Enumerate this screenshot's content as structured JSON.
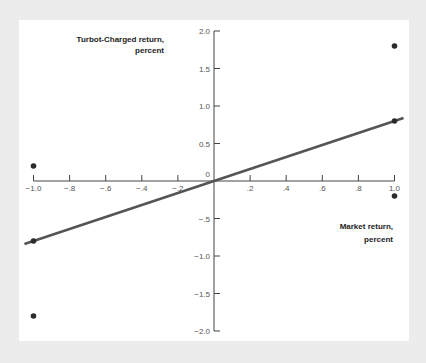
{
  "chart_data": {
    "type": "scatter",
    "title": "",
    "xlabel": "Market return, percent",
    "ylabel": "Turbot-Charged return, percent",
    "xlim": [
      -1.0,
      1.0
    ],
    "ylim": [
      -2.0,
      2.0
    ],
    "x_ticks": [
      -1.0,
      -0.8,
      -0.6,
      -0.4,
      -0.2,
      0.2,
      0.4,
      0.6,
      0.8,
      1.0
    ],
    "x_tick_labels": [
      "−1.0",
      "−.8",
      "−.6",
      "−.4",
      "−.2",
      ".2",
      ".4",
      ".6",
      ".8",
      "1.0"
    ],
    "y_ticks": [
      2.0,
      1.5,
      1.0,
      0.5,
      0,
      -0.5,
      -1.0,
      -1.5,
      -2.0
    ],
    "y_tick_labels": [
      "2.0",
      "1.5",
      "1.0",
      "0.5",
      "0",
      "−.5",
      "−1.0",
      "−1.5",
      "−2.0"
    ],
    "grid": false,
    "legend": null,
    "series": [
      {
        "name": "points",
        "type": "scatter",
        "points": [
          {
            "x": -1.0,
            "y": 0.2
          },
          {
            "x": -1.0,
            "y": -0.8
          },
          {
            "x": -1.0,
            "y": -1.8
          },
          {
            "x": 1.0,
            "y": 1.8
          },
          {
            "x": 1.0,
            "y": 0.8
          },
          {
            "x": 1.0,
            "y": -0.2
          }
        ]
      },
      {
        "name": "fitted line",
        "type": "line",
        "slope": 0.8,
        "points": [
          {
            "x": -1.05,
            "y": -0.84
          },
          {
            "x": 1.05,
            "y": 0.84
          }
        ]
      }
    ],
    "colors": {
      "points": "#2b2b2b",
      "line": "#555555",
      "axis": "#444444",
      "background": "#ffffff",
      "frame": "#ececec"
    }
  },
  "labels": {
    "y_title_line1": "Turbot-Charged return,",
    "y_title_line2": "percent",
    "x_title_line1": "Market return,",
    "x_title_line2": "percent",
    "origin": "0"
  }
}
